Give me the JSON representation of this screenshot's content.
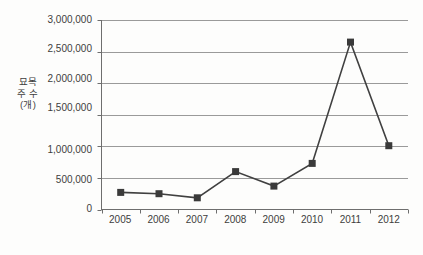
{
  "chart_data": {
    "type": "line",
    "title": "",
    "xlabel": "",
    "ylabel": "묘목\n주 수\n(개)",
    "ylabel_lines": [
      "묘목",
      "주 수",
      "(개)"
    ],
    "categories": [
      "2005",
      "2006",
      "2007",
      "2008",
      "2009",
      "2010",
      "2011",
      "2012"
    ],
    "values": [
      270000,
      250000,
      185000,
      600000,
      370000,
      730000,
      2650000,
      1010000
    ],
    "series": [
      {
        "name": "묘목 주 수",
        "values": [
          270000,
          250000,
          185000,
          600000,
          370000,
          730000,
          2650000,
          1010000
        ]
      }
    ],
    "ylim": [
      0,
      3000000
    ],
    "ytick_values": [
      0,
      500000,
      1000000,
      1500000,
      2000000,
      2500000,
      3000000
    ],
    "ytick_labels": [
      "0",
      "500,000",
      "1,000,000",
      "1,500,000",
      "2,000,000",
      "2,500,000",
      "3,000,000"
    ],
    "grid": true,
    "grid_axis": "y",
    "legend": false,
    "legend_position": "none",
    "marker": "square",
    "colors": {
      "line": "#404040",
      "marker": "#3a3a3a",
      "grid": "#9a9a9a",
      "axis": "#6e6e6e",
      "text": "#3d3d3d",
      "background": "#fdfdfc"
    }
  }
}
